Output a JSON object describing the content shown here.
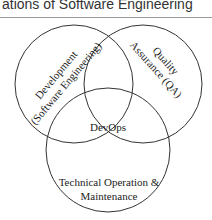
{
  "header": {
    "title": "ations of Software Engineering"
  },
  "diagram": {
    "type": "venn",
    "circles": [
      {
        "id": "development",
        "line1": "Development",
        "line2": "(Software Engineering)"
      },
      {
        "id": "qa",
        "line1": "Quality",
        "line2": "Assurance (QA)"
      },
      {
        "id": "operations",
        "line1": "Technical Operation &",
        "line2": "Maintenance"
      }
    ],
    "center_label": "DevOps",
    "stroke_color": "#333333"
  }
}
